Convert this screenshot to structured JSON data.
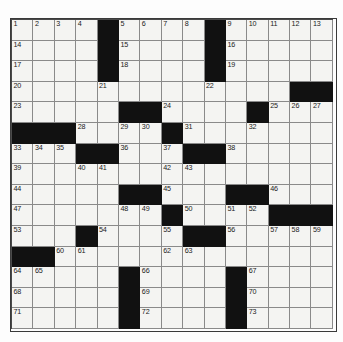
{
  "puzzle": {
    "name": "crossword-grid",
    "columns": 15,
    "rows": 15,
    "colors": {
      "block": "#111111",
      "cell": "#f4f4f2",
      "gridline": "#8a8a8a",
      "border": "#3a3a3a",
      "number": "#1a1a1a",
      "page": "#ffffff"
    },
    "grid": [
      [
        {
          "block": false,
          "num": "1"
        },
        {
          "block": false,
          "num": "2"
        },
        {
          "block": false,
          "num": "3"
        },
        {
          "block": false,
          "num": "4"
        },
        {
          "block": true,
          "num": ""
        },
        {
          "block": false,
          "num": "5"
        },
        {
          "block": false,
          "num": "6"
        },
        {
          "block": false,
          "num": "7"
        },
        {
          "block": false,
          "num": "8"
        },
        {
          "block": true,
          "num": ""
        },
        {
          "block": false,
          "num": "9"
        },
        {
          "block": false,
          "num": "10"
        },
        {
          "block": false,
          "num": "11"
        },
        {
          "block": false,
          "num": "12"
        },
        {
          "block": false,
          "num": "13"
        }
      ],
      [
        {
          "block": false,
          "num": "14"
        },
        {
          "block": false,
          "num": ""
        },
        {
          "block": false,
          "num": ""
        },
        {
          "block": false,
          "num": ""
        },
        {
          "block": true,
          "num": ""
        },
        {
          "block": false,
          "num": "15"
        },
        {
          "block": false,
          "num": ""
        },
        {
          "block": false,
          "num": ""
        },
        {
          "block": false,
          "num": ""
        },
        {
          "block": true,
          "num": ""
        },
        {
          "block": false,
          "num": "16"
        },
        {
          "block": false,
          "num": ""
        },
        {
          "block": false,
          "num": ""
        },
        {
          "block": false,
          "num": ""
        },
        {
          "block": false,
          "num": ""
        }
      ],
      [
        {
          "block": false,
          "num": "17"
        },
        {
          "block": false,
          "num": ""
        },
        {
          "block": false,
          "num": ""
        },
        {
          "block": false,
          "num": ""
        },
        {
          "block": true,
          "num": ""
        },
        {
          "block": false,
          "num": "18"
        },
        {
          "block": false,
          "num": ""
        },
        {
          "block": false,
          "num": ""
        },
        {
          "block": false,
          "num": ""
        },
        {
          "block": true,
          "num": ""
        },
        {
          "block": false,
          "num": "19"
        },
        {
          "block": false,
          "num": ""
        },
        {
          "block": false,
          "num": ""
        },
        {
          "block": false,
          "num": ""
        },
        {
          "block": false,
          "num": ""
        }
      ],
      [
        {
          "block": false,
          "num": "20"
        },
        {
          "block": false,
          "num": ""
        },
        {
          "block": false,
          "num": ""
        },
        {
          "block": false,
          "num": ""
        },
        {
          "block": false,
          "num": "21"
        },
        {
          "block": false,
          "num": ""
        },
        {
          "block": false,
          "num": ""
        },
        {
          "block": false,
          "num": ""
        },
        {
          "block": false,
          "num": ""
        },
        {
          "block": false,
          "num": "22"
        },
        {
          "block": false,
          "num": ""
        },
        {
          "block": false,
          "num": ""
        },
        {
          "block": false,
          "num": ""
        },
        {
          "block": true,
          "num": ""
        },
        {
          "block": true,
          "num": ""
        }
      ],
      [
        {
          "block": false,
          "num": "23"
        },
        {
          "block": false,
          "num": ""
        },
        {
          "block": false,
          "num": ""
        },
        {
          "block": false,
          "num": ""
        },
        {
          "block": false,
          "num": ""
        },
        {
          "block": true,
          "num": ""
        },
        {
          "block": true,
          "num": ""
        },
        {
          "block": false,
          "num": "24"
        },
        {
          "block": false,
          "num": ""
        },
        {
          "block": false,
          "num": ""
        },
        {
          "block": false,
          "num": ""
        },
        {
          "block": true,
          "num": ""
        },
        {
          "block": false,
          "num": "25"
        },
        {
          "block": false,
          "num": "26"
        },
        {
          "block": false,
          "num": "27"
        }
      ],
      [
        {
          "block": true,
          "num": ""
        },
        {
          "block": true,
          "num": ""
        },
        {
          "block": true,
          "num": ""
        },
        {
          "block": false,
          "num": "28"
        },
        {
          "block": false,
          "num": ""
        },
        {
          "block": false,
          "num": "29"
        },
        {
          "block": false,
          "num": "30"
        },
        {
          "block": true,
          "num": ""
        },
        {
          "block": false,
          "num": "31"
        },
        {
          "block": false,
          "num": ""
        },
        {
          "block": false,
          "num": ""
        },
        {
          "block": false,
          "num": "32"
        },
        {
          "block": false,
          "num": ""
        },
        {
          "block": false,
          "num": ""
        },
        {
          "block": false,
          "num": ""
        }
      ],
      [
        {
          "block": false,
          "num": "33"
        },
        {
          "block": false,
          "num": "34"
        },
        {
          "block": false,
          "num": "35"
        },
        {
          "block": true,
          "num": ""
        },
        {
          "block": true,
          "num": ""
        },
        {
          "block": false,
          "num": "36"
        },
        {
          "block": false,
          "num": ""
        },
        {
          "block": false,
          "num": "37"
        },
        {
          "block": true,
          "num": ""
        },
        {
          "block": true,
          "num": ""
        },
        {
          "block": false,
          "num": "38"
        },
        {
          "block": false,
          "num": ""
        },
        {
          "block": false,
          "num": ""
        },
        {
          "block": false,
          "num": ""
        },
        {
          "block": false,
          "num": ""
        }
      ],
      [
        {
          "block": false,
          "num": "39"
        },
        {
          "block": false,
          "num": ""
        },
        {
          "block": false,
          "num": ""
        },
        {
          "block": false,
          "num": "40"
        },
        {
          "block": false,
          "num": "41"
        },
        {
          "block": false,
          "num": ""
        },
        {
          "block": false,
          "num": ""
        },
        {
          "block": false,
          "num": "42"
        },
        {
          "block": false,
          "num": "43"
        },
        {
          "block": false,
          "num": ""
        },
        {
          "block": false,
          "num": ""
        },
        {
          "block": false,
          "num": ""
        },
        {
          "block": false,
          "num": ""
        },
        {
          "block": false,
          "num": ""
        },
        {
          "block": false,
          "num": ""
        }
      ],
      [
        {
          "block": false,
          "num": "44"
        },
        {
          "block": false,
          "num": ""
        },
        {
          "block": false,
          "num": ""
        },
        {
          "block": false,
          "num": ""
        },
        {
          "block": false,
          "num": ""
        },
        {
          "block": true,
          "num": ""
        },
        {
          "block": true,
          "num": ""
        },
        {
          "block": false,
          "num": "45"
        },
        {
          "block": false,
          "num": ""
        },
        {
          "block": false,
          "num": ""
        },
        {
          "block": true,
          "num": ""
        },
        {
          "block": true,
          "num": ""
        },
        {
          "block": false,
          "num": "46"
        },
        {
          "block": false,
          "num": ""
        },
        {
          "block": false,
          "num": ""
        }
      ],
      [
        {
          "block": false,
          "num": "47"
        },
        {
          "block": false,
          "num": ""
        },
        {
          "block": false,
          "num": ""
        },
        {
          "block": false,
          "num": ""
        },
        {
          "block": false,
          "num": ""
        },
        {
          "block": false,
          "num": "48"
        },
        {
          "block": false,
          "num": "49"
        },
        {
          "block": true,
          "num": ""
        },
        {
          "block": false,
          "num": "50"
        },
        {
          "block": false,
          "num": ""
        },
        {
          "block": false,
          "num": "51"
        },
        {
          "block": false,
          "num": "52"
        },
        {
          "block": true,
          "num": ""
        },
        {
          "block": true,
          "num": ""
        },
        {
          "block": true,
          "num": ""
        }
      ],
      [
        {
          "block": false,
          "num": "53"
        },
        {
          "block": false,
          "num": ""
        },
        {
          "block": false,
          "num": ""
        },
        {
          "block": true,
          "num": ""
        },
        {
          "block": false,
          "num": "54"
        },
        {
          "block": false,
          "num": ""
        },
        {
          "block": false,
          "num": ""
        },
        {
          "block": false,
          "num": "55"
        },
        {
          "block": true,
          "num": ""
        },
        {
          "block": true,
          "num": ""
        },
        {
          "block": false,
          "num": "56"
        },
        {
          "block": false,
          "num": ""
        },
        {
          "block": false,
          "num": "57"
        },
        {
          "block": false,
          "num": "58"
        },
        {
          "block": false,
          "num": "59"
        }
      ],
      [
        {
          "block": true,
          "num": ""
        },
        {
          "block": true,
          "num": ""
        },
        {
          "block": false,
          "num": "60"
        },
        {
          "block": false,
          "num": "61"
        },
        {
          "block": false,
          "num": ""
        },
        {
          "block": false,
          "num": ""
        },
        {
          "block": false,
          "num": ""
        },
        {
          "block": false,
          "num": "62"
        },
        {
          "block": false,
          "num": "63"
        },
        {
          "block": false,
          "num": ""
        },
        {
          "block": false,
          "num": ""
        },
        {
          "block": false,
          "num": ""
        },
        {
          "block": false,
          "num": ""
        },
        {
          "block": false,
          "num": ""
        },
        {
          "block": false,
          "num": ""
        }
      ],
      [
        {
          "block": false,
          "num": "64"
        },
        {
          "block": false,
          "num": "65"
        },
        {
          "block": false,
          "num": ""
        },
        {
          "block": false,
          "num": ""
        },
        {
          "block": false,
          "num": ""
        },
        {
          "block": true,
          "num": ""
        },
        {
          "block": false,
          "num": "66"
        },
        {
          "block": false,
          "num": ""
        },
        {
          "block": false,
          "num": ""
        },
        {
          "block": false,
          "num": ""
        },
        {
          "block": true,
          "num": ""
        },
        {
          "block": false,
          "num": "67"
        },
        {
          "block": false,
          "num": ""
        },
        {
          "block": false,
          "num": ""
        },
        {
          "block": false,
          "num": ""
        }
      ],
      [
        {
          "block": false,
          "num": "68"
        },
        {
          "block": false,
          "num": ""
        },
        {
          "block": false,
          "num": ""
        },
        {
          "block": false,
          "num": ""
        },
        {
          "block": false,
          "num": ""
        },
        {
          "block": true,
          "num": ""
        },
        {
          "block": false,
          "num": "69"
        },
        {
          "block": false,
          "num": ""
        },
        {
          "block": false,
          "num": ""
        },
        {
          "block": false,
          "num": ""
        },
        {
          "block": true,
          "num": ""
        },
        {
          "block": false,
          "num": "70"
        },
        {
          "block": false,
          "num": ""
        },
        {
          "block": false,
          "num": ""
        },
        {
          "block": false,
          "num": ""
        }
      ],
      [
        {
          "block": false,
          "num": "71"
        },
        {
          "block": false,
          "num": ""
        },
        {
          "block": false,
          "num": ""
        },
        {
          "block": false,
          "num": ""
        },
        {
          "block": false,
          "num": ""
        },
        {
          "block": true,
          "num": ""
        },
        {
          "block": false,
          "num": "72"
        },
        {
          "block": false,
          "num": ""
        },
        {
          "block": false,
          "num": ""
        },
        {
          "block": false,
          "num": ""
        },
        {
          "block": true,
          "num": ""
        },
        {
          "block": false,
          "num": "73"
        },
        {
          "block": false,
          "num": ""
        },
        {
          "block": false,
          "num": ""
        },
        {
          "block": false,
          "num": ""
        }
      ]
    ]
  }
}
